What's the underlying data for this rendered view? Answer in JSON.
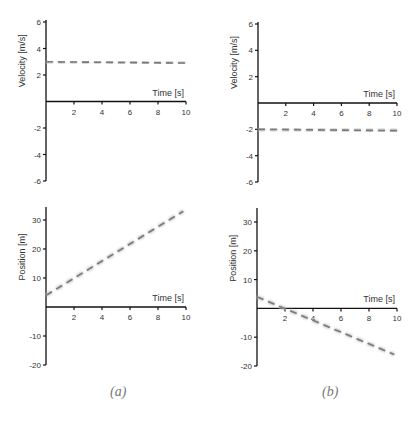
{
  "captions": {
    "a": "(a)",
    "b": "(b)"
  },
  "styles": {
    "axis_color": "#111111",
    "line_color": "#7a7a7a",
    "line_shadow": "#bbbbbb",
    "text_color": "#333333"
  },
  "chart_data": [
    {
      "id": "a-velocity",
      "panel": "a",
      "type": "line",
      "title": "",
      "xlabel": "Time [s]",
      "ylabel": "Velocity [m/s]",
      "xlim": [
        0,
        10
      ],
      "ylim": [
        -6,
        6
      ],
      "xticks": [
        2,
        4,
        6,
        8,
        10
      ],
      "yticks": [
        -6,
        -4,
        -2,
        2,
        4,
        6
      ],
      "grid": false,
      "series": [
        {
          "name": "velocity",
          "style": "dashed",
          "x": [
            0,
            10
          ],
          "y": [
            3,
            2.9
          ]
        }
      ],
      "frame": {
        "x0": 46,
        "x1": 186,
        "yTop": 22,
        "yBottom": 181,
        "yTopVal": 6,
        "yBottomVal": -6,
        "axisTop": 20
      }
    },
    {
      "id": "b-velocity",
      "panel": "b",
      "type": "line",
      "title": "",
      "xlabel": "Time [s]",
      "ylabel": "Velocity [m/s]",
      "xlim": [
        0,
        10
      ],
      "ylim": [
        -6,
        6
      ],
      "xticks": [
        2,
        4,
        6,
        8,
        10
      ],
      "yticks": [
        -6,
        -4,
        -2,
        2,
        4,
        6
      ],
      "grid": false,
      "series": [
        {
          "name": "velocity",
          "style": "dashed",
          "x": [
            0,
            10
          ],
          "y": [
            -2,
            -2.1
          ]
        }
      ],
      "frame": {
        "x0": 258,
        "x1": 397,
        "yTop": 24,
        "yBottom": 182,
        "yTopVal": 6,
        "yBottomVal": -6,
        "axisTop": 22
      }
    },
    {
      "id": "a-position",
      "panel": "a",
      "type": "line",
      "title": "",
      "xlabel": "Time [s]",
      "ylabel": "Position [m]",
      "xlim": [
        0,
        10
      ],
      "ylim": [
        -20,
        35
      ],
      "xticks": [
        2,
        4,
        6,
        8,
        10
      ],
      "yticks": [
        -20,
        -10,
        10,
        20,
        30
      ],
      "grid": false,
      "series": [
        {
          "name": "position",
          "style": "dashed",
          "x": [
            0,
            9.8
          ],
          "y": [
            4,
            33
          ]
        }
      ],
      "frame": {
        "x0": 46,
        "x1": 186,
        "yTop": 220,
        "yBottom": 365,
        "yTopVal": 30,
        "yBottomVal": -20,
        "axisTop": 207
      }
    },
    {
      "id": "b-position",
      "panel": "b",
      "type": "line",
      "title": "",
      "xlabel": "Time [s]",
      "ylabel": "Position [m]",
      "xlim": [
        0,
        10
      ],
      "ylim": [
        -20,
        35
      ],
      "xticks": [
        2,
        4,
        6,
        8,
        10
      ],
      "yticks": [
        -20,
        -10,
        10,
        20,
        30
      ],
      "grid": false,
      "series": [
        {
          "name": "position",
          "style": "dashed",
          "x": [
            0,
            9.8
          ],
          "y": [
            4,
            -16
          ]
        }
      ],
      "frame": {
        "x0": 257,
        "x1": 397,
        "yTop": 222,
        "yBottom": 366,
        "yTopVal": 30,
        "yBottomVal": -20,
        "axisTop": 208
      }
    }
  ]
}
